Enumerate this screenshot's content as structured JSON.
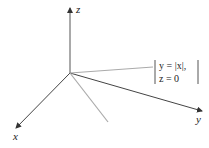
{
  "diagram": {
    "axes": {
      "z_label": "z",
      "x_label": "x",
      "y_label": "y"
    },
    "equation": {
      "line1": "y = |x|,",
      "line2": "z = 0"
    },
    "colors": {
      "axis": "#333333",
      "curve": "#aaaaaa",
      "text": "#222222"
    }
  }
}
